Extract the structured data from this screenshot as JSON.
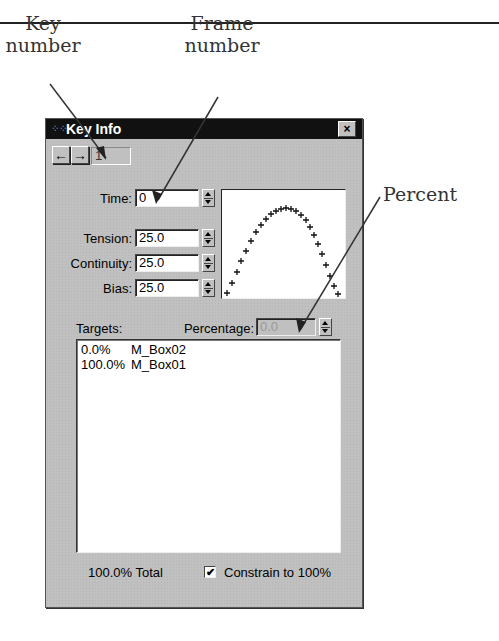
{
  "annotations": {
    "key_number": "Key\nnumber",
    "key_number_line1": "Key",
    "key_number_line2": "number",
    "frame_number_line1": "Frame",
    "frame_number_line2": "number",
    "percent": "Percent"
  },
  "dialog": {
    "title": "Key Info",
    "close_icon": "×",
    "nav": {
      "prev_icon": "←",
      "next_icon": "→",
      "key_number": "1"
    },
    "fields": {
      "time": {
        "label": "Time:",
        "value": "0"
      },
      "tension": {
        "label": "Tension:",
        "value": "25.0"
      },
      "continuity": {
        "label": "Continuity:",
        "value": "25.0"
      },
      "bias": {
        "label": "Bias:",
        "value": "25.0"
      }
    },
    "targets_label": "Targets:",
    "percentage": {
      "label": "Percentage:",
      "value": "0.0",
      "disabled": true
    },
    "targets": [
      {
        "percent": "0.0%",
        "name": "M_Box02"
      },
      {
        "percent": "100.0%",
        "name": "M_Box01"
      }
    ],
    "total": "100.0% Total",
    "constrain": {
      "label": "Constrain to 100%",
      "checked": true,
      "check_glyph": "✔"
    }
  }
}
